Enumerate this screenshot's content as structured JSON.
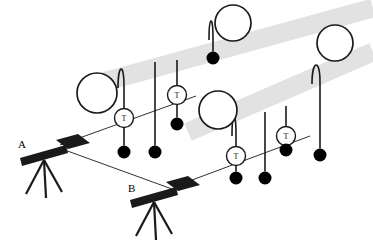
{
  "diagram": {
    "background_color": "#ffffff",
    "line_color": "#1a1a1a",
    "band_color": "#e2e2e2",
    "ball_color": "#000000",
    "balloon_fill": "#ffffff",
    "marker_fill": "#ffffff",
    "width": 373,
    "height": 242
  },
  "instruments": [
    {
      "id": "A",
      "label": "A",
      "label_x": 18,
      "label_y": 148,
      "head_x": 62,
      "head_y": 146,
      "body_angle": -16,
      "legs": 3
    },
    {
      "id": "B",
      "label": "B",
      "label_x": 128,
      "label_y": 192,
      "head_x": 172,
      "head_y": 188,
      "body_angle": -16,
      "legs": 3
    }
  ],
  "sight_lines": [
    {
      "name": "baseline-a-to-b",
      "x1": 62,
      "y1": 149,
      "x2": 172,
      "y2": 189
    },
    {
      "name": "sight-a-upper",
      "x1": 60,
      "y1": 145,
      "x2": 196,
      "y2": 96
    },
    {
      "name": "sight-b-upper",
      "x1": 176,
      "y1": 186,
      "x2": 310,
      "y2": 136
    }
  ],
  "bands": [
    {
      "name": "upper-band",
      "x1": 96,
      "y1": 84,
      "x2": 373,
      "y2": 8,
      "thickness": 19
    },
    {
      "name": "lower-band",
      "x1": 188,
      "y1": 132,
      "x2": 373,
      "y2": 52,
      "thickness": 19
    }
  ],
  "balloons": [
    {
      "name": "balloon-1",
      "cx": 97,
      "cy": 93,
      "r": 20
    },
    {
      "name": "balloon-2",
      "cx": 233,
      "cy": 23,
      "r": 18
    },
    {
      "name": "balloon-3",
      "cx": 218,
      "cy": 110,
      "r": 19
    },
    {
      "name": "balloon-4",
      "cx": 335,
      "cy": 43,
      "r": 18
    }
  ],
  "drops": [
    {
      "name": "drop-1",
      "hook": true,
      "hook_dir": "left",
      "top_x": 118,
      "top_y": 72,
      "ball_x": 124,
      "ball_y": 152,
      "marker": "T",
      "marker_y": 118
    },
    {
      "name": "drop-2",
      "hook": false,
      "hook_dir": "none",
      "top_x": 155,
      "top_y": 62,
      "ball_x": 155,
      "ball_y": 152,
      "marker": null,
      "marker_y": null
    },
    {
      "name": "drop-3",
      "hook": false,
      "hook_dir": "none",
      "top_x": 177,
      "top_y": 60,
      "ball_x": 177,
      "ball_y": 124,
      "marker": "T",
      "marker_y": 95
    },
    {
      "name": "drop-4",
      "hook": true,
      "hook_dir": "left",
      "top_x": 209,
      "top_y": 24,
      "ball_x": 213,
      "ball_y": 58,
      "marker": null,
      "marker_y": null
    },
    {
      "name": "drop-5",
      "hook": true,
      "hook_dir": "left",
      "top_x": 232,
      "top_y": 120,
      "ball_x": 236,
      "ball_y": 178,
      "marker": "T",
      "marker_y": 156
    },
    {
      "name": "drop-6",
      "hook": false,
      "hook_dir": "none",
      "top_x": 265,
      "top_y": 112,
      "ball_x": 265,
      "ball_y": 178,
      "marker": null,
      "marker_y": null
    },
    {
      "name": "drop-7",
      "hook": false,
      "hook_dir": "none",
      "top_x": 286,
      "top_y": 106,
      "ball_x": 286,
      "ball_y": 150,
      "marker": "T",
      "marker_y": 136
    },
    {
      "name": "drop-8",
      "hook": true,
      "hook_dir": "left",
      "top_x": 312,
      "top_y": 68,
      "ball_x": 320,
      "ball_y": 155,
      "marker": null,
      "marker_y": null
    }
  ],
  "marker_label": "T",
  "ball_radius": 6.5,
  "marker_radius": 9.5
}
